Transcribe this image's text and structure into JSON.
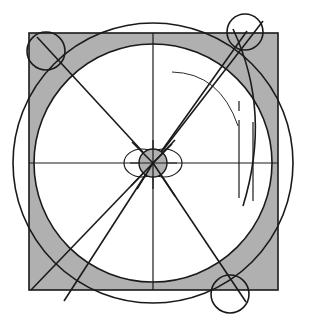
{
  "figure": {
    "background_color": "#ffffff",
    "line_color": "#1a1a1a",
    "shade_color": "#b0b0b0"
  },
  "canvas": {
    "width": 311,
    "height": 327
  },
  "square": {
    "name": "bounding-square",
    "x": 29,
    "y": 33,
    "width": 249,
    "height": 257,
    "stroke_width": 1.6
  },
  "center": {
    "x": 153,
    "y": 163
  },
  "circles": {
    "outer": {
      "cx": 153,
      "cy": 163,
      "r": 140
    },
    "inner": {
      "cx": 153,
      "cy": 163,
      "r": 119
    },
    "hub_filled": {
      "cx": 153,
      "cy": 163,
      "r": 14
    },
    "hub_left": {
      "cx": 142,
      "cy": 163,
      "rx": 18,
      "ry": 14
    },
    "hub_right": {
      "cx": 164,
      "cy": 163,
      "rx": 18,
      "ry": 14
    },
    "corner_top_left": {
      "cx": 46,
      "cy": 51,
      "r": 19
    },
    "corner_top_right": {
      "cx": 245,
      "cy": 32,
      "r": 18
    },
    "corner_bottom_right": {
      "cx": 230,
      "cy": 294,
      "r": 19
    }
  },
  "axes": {
    "horizontal": {
      "x1": 29,
      "y1": 163,
      "x2": 278,
      "y2": 163
    },
    "vertical": {
      "x1": 153,
      "y1": 33,
      "x2": 153,
      "y2": 290
    }
  },
  "rays": [
    {
      "name": "ray-up-right-steep",
      "x1": 153,
      "y1": 163,
      "x2": 262,
      "y2": 22
    },
    {
      "name": "ray-up-right-shallow",
      "x1": 153,
      "y1": 163,
      "x2": 246,
      "y2": 33
    },
    {
      "name": "ray-up-left",
      "x1": 153,
      "y1": 163,
      "x2": 40,
      "y2": 40
    },
    {
      "name": "ray-down-left-a",
      "x1": 153,
      "y1": 163,
      "x2": 33,
      "y2": 289
    },
    {
      "name": "ray-down-left-b",
      "x1": 153,
      "y1": 163,
      "x2": 62,
      "y2": 299
    },
    {
      "name": "ray-down-right",
      "x1": 153,
      "y1": 163,
      "x2": 245,
      "y2": 300
    }
  ],
  "verticals": [
    {
      "name": "tick-short-right",
      "x": 239,
      "y1": 101,
      "y2": 111
    },
    {
      "name": "line-right-inner",
      "x": 239,
      "y1": 120,
      "y2": 198
    },
    {
      "name": "line-right-outer",
      "x": 253,
      "y1": 122,
      "y2": 201
    }
  ],
  "arcs": [
    {
      "name": "arc-upper-right-thin",
      "d": "M 172 72 Q 222 74 240 124"
    },
    {
      "name": "arc-right-sweep",
      "d": "M 247 40 Q 268 118 243 198"
    }
  ],
  "shaded_corners": [
    {
      "name": "shade-top-left",
      "corner": "top-left"
    },
    {
      "name": "shade-top-right",
      "corner": "top-right"
    },
    {
      "name": "shade-bottom-left",
      "corner": "bottom-left"
    },
    {
      "name": "shade-bottom-right",
      "corner": "bottom-right"
    }
  ]
}
